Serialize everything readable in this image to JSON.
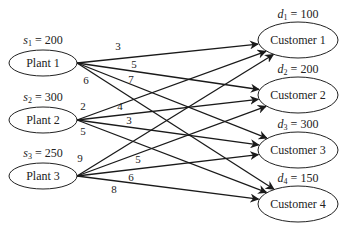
{
  "diagram": {
    "type": "transportation-network",
    "plants": [
      {
        "id": "P1",
        "label": "Plant  1",
        "supply_var": "s",
        "supply_sub": "1",
        "supply_value": "= 200",
        "cx": 43,
        "cy": 63
      },
      {
        "id": "P2",
        "label": "Plant  2",
        "supply_var": "s",
        "supply_sub": "2",
        "supply_value": "= 300",
        "cx": 43,
        "cy": 120
      },
      {
        "id": "P3",
        "label": "Plant  3",
        "supply_var": "s",
        "supply_sub": "3",
        "supply_value": "= 250",
        "cx": 43,
        "cy": 176
      }
    ],
    "customers": [
      {
        "id": "C1",
        "label": "Customer 1",
        "demand_var": "d",
        "demand_sub": "1",
        "demand_value": "= 100",
        "cx": 298,
        "cy": 40
      },
      {
        "id": "C2",
        "label": "Customer 2",
        "demand_var": "d",
        "demand_sub": "2",
        "demand_value": "= 200",
        "cx": 298,
        "cy": 95
      },
      {
        "id": "C3",
        "label": "Customer 3",
        "demand_var": "d",
        "demand_sub": "3",
        "demand_value": "= 300",
        "cx": 298,
        "cy": 150
      },
      {
        "id": "C4",
        "label": "Customer 4",
        "demand_var": "d",
        "demand_sub": "4",
        "demand_value": "= 150",
        "cx": 298,
        "cy": 204
      }
    ],
    "edges": [
      {
        "from": "P1",
        "to": "C1",
        "cost": "3",
        "lx": 118,
        "ly": 50
      },
      {
        "from": "P1",
        "to": "C2",
        "cost": "5",
        "lx": 134,
        "ly": 68
      },
      {
        "from": "P1",
        "to": "C3",
        "cost": "7",
        "lx": 131,
        "ly": 83
      },
      {
        "from": "P1",
        "to": "C4",
        "cost": "6",
        "lx": 86,
        "ly": 84
      },
      {
        "from": "P2",
        "to": "C1",
        "cost": "2",
        "lx": 83,
        "ly": 110
      },
      {
        "from": "P2",
        "to": "C2",
        "cost": "4",
        "lx": 120,
        "ly": 110
      },
      {
        "from": "P2",
        "to": "C3",
        "cost": "3",
        "lx": 129,
        "ly": 124
      },
      {
        "from": "P2",
        "to": "C4",
        "cost": "5",
        "lx": 83,
        "ly": 135
      },
      {
        "from": "P3",
        "to": "C1",
        "cost": "9",
        "lx": 80,
        "ly": 162
      },
      {
        "from": "P3",
        "to": "C2",
        "cost": "5",
        "lx": 138,
        "ly": 163
      },
      {
        "from": "P3",
        "to": "C3",
        "cost": "6",
        "lx": 131,
        "ly": 181
      },
      {
        "from": "P3",
        "to": "C4",
        "cost": "8",
        "lx": 114,
        "ly": 193
      }
    ]
  }
}
